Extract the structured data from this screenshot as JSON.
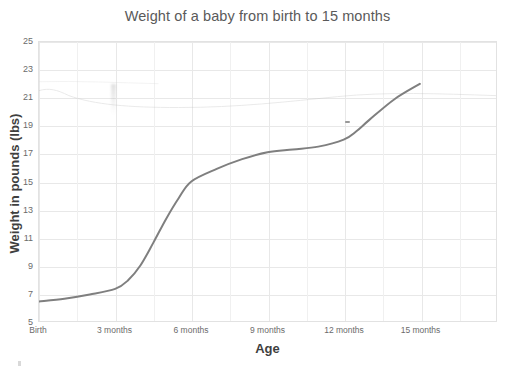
{
  "chart_data": {
    "type": "line",
    "title": "Weight of a baby from birth to 15 months",
    "xlabel": "Age",
    "ylabel": "Weight in pounds (lbs)",
    "x_tick_labels": [
      "Birth",
      "3 months",
      "6 months",
      "9 months",
      "12 months",
      "15 months"
    ],
    "x_tick_values": [
      0,
      3,
      6,
      9,
      12,
      15
    ],
    "y_tick_labels": [
      "5",
      "7",
      "9",
      "11",
      "13",
      "15",
      "17",
      "19",
      "21",
      "23",
      "25"
    ],
    "y_tick_values": [
      5,
      7,
      9,
      11,
      13,
      15,
      17,
      19,
      21,
      23,
      25
    ],
    "xlim": [
      0,
      18
    ],
    "ylim": [
      5,
      25
    ],
    "grid": true,
    "legend": false,
    "series": [
      {
        "name": "Baby weight",
        "color": "#7f7f7f",
        "x": [
          0,
          1,
          2,
          3,
          3.5,
          4,
          4.5,
          5,
          5.5,
          6,
          7,
          8,
          9,
          10,
          11,
          12,
          12.5,
          13,
          14,
          15
        ],
        "values": [
          6.4,
          6.6,
          6.9,
          7.3,
          7.9,
          9.0,
          10.6,
          12.3,
          13.8,
          15.0,
          15.9,
          16.6,
          17.1,
          17.3,
          17.5,
          18.0,
          18.6,
          19.4,
          20.9,
          22.0
        ]
      }
    ],
    "annotations": []
  },
  "axis": {
    "y_axis_range_note": "5 to 25 by 2",
    "x_axis_range_note": "Birth to 15 months by 3"
  }
}
